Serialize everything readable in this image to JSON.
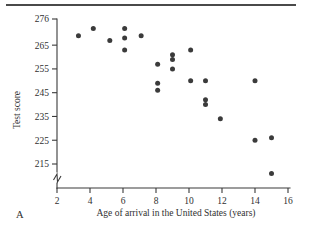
{
  "figure": {
    "panel_label": "A",
    "y_axis_title": "Test score",
    "x_axis_title": "Age of arrival in the United States (years)"
  },
  "chart_data": {
    "type": "scatter",
    "title": "",
    "subtitle": "",
    "xlabel": "Age of arrival in the United States (years)",
    "ylabel": "Test score",
    "xlim": [
      2,
      16
    ],
    "ylim": [
      211,
      278
    ],
    "grid": false,
    "legend": null,
    "y_axis_break": true,
    "y_axis_break_note": "axis break between 215 and the x-axis baseline",
    "xticks": [
      2,
      4,
      6,
      8,
      10,
      12,
      14,
      16
    ],
    "xtick_labels": [
      "2",
      "4",
      "6",
      "8",
      "10",
      "12",
      "14",
      "16"
    ],
    "yticks": [
      215,
      225,
      235,
      245,
      255,
      265,
      276
    ],
    "ytick_labels": [
      "215",
      "225",
      "235",
      "245",
      "255",
      "265",
      "276"
    ],
    "marker": "filled-circle",
    "marker_color": "#3b3b3b",
    "points": [
      {
        "x": 3.3,
        "y": 269
      },
      {
        "x": 4.2,
        "y": 272
      },
      {
        "x": 5.2,
        "y": 267
      },
      {
        "x": 6.1,
        "y": 272
      },
      {
        "x": 6.1,
        "y": 268
      },
      {
        "x": 6.1,
        "y": 263
      },
      {
        "x": 7.1,
        "y": 269
      },
      {
        "x": 8.1,
        "y": 257
      },
      {
        "x": 8.1,
        "y": 249
      },
      {
        "x": 8.1,
        "y": 246
      },
      {
        "x": 9.0,
        "y": 261
      },
      {
        "x": 9.0,
        "y": 259
      },
      {
        "x": 9.0,
        "y": 255
      },
      {
        "x": 10.1,
        "y": 263
      },
      {
        "x": 10.1,
        "y": 250
      },
      {
        "x": 11.0,
        "y": 250
      },
      {
        "x": 11.0,
        "y": 242
      },
      {
        "x": 11.0,
        "y": 240
      },
      {
        "x": 11.9,
        "y": 234
      },
      {
        "x": 14.0,
        "y": 250
      },
      {
        "x": 14.0,
        "y": 225
      },
      {
        "x": 15.0,
        "y": 226
      },
      {
        "x": 15.0,
        "y": 211
      }
    ]
  }
}
